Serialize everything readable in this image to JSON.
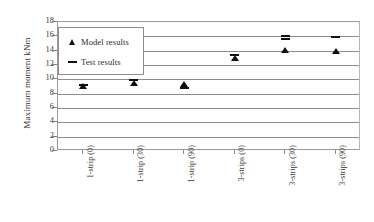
{
  "chart_data": {
    "type": "scatter",
    "title": "",
    "xlabel": "",
    "ylabel": "Maximum moment  kNm",
    "ylim": [
      0,
      18
    ],
    "ytick_step": 2,
    "yticks": [
      "0",
      "2",
      "4",
      "6",
      "8",
      "10",
      "12",
      "14",
      "16",
      "18"
    ],
    "grid": true,
    "legend_position": "upper-left-inside",
    "categories": [
      "1-strip (0)",
      "1-strip (30)",
      "1-strip (90)",
      "3-strips (0)",
      "3-strips (30)",
      "3-strips (90)"
    ],
    "series": [
      {
        "name": "Model results",
        "marker": "triangle",
        "color": "#101010",
        "values": [
          9.0,
          9.4,
          9.3,
          12.9,
          14.0,
          13.9
        ]
      },
      {
        "name": "Test results",
        "marker": "dash",
        "color": "#101010",
        "values": [
          9.2,
          9.9,
          8.8,
          13.4,
          16.1,
          15.9
        ]
      },
      {
        "name": "Test results (second specimen)",
        "marker": "dash",
        "color": "#101010",
        "values": [
          null,
          null,
          null,
          null,
          15.6,
          null
        ]
      }
    ]
  },
  "legend": {
    "entries": [
      {
        "glyph": "triangle-up-icon",
        "label": "Model results"
      },
      {
        "glyph": "horizontal-dash-icon",
        "label": "Test results"
      }
    ]
  },
  "axes": {
    "y_title": "Maximum moment  kNm"
  }
}
